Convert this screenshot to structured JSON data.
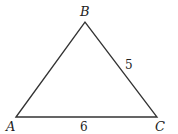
{
  "figure": {
    "type": "triangle",
    "vertices": [
      {
        "label": "A",
        "x": 16,
        "y": 117
      },
      {
        "label": "B",
        "x": 85,
        "y": 22
      },
      {
        "label": "C",
        "x": 157,
        "y": 117
      }
    ],
    "side_labels": {
      "BC": "5",
      "AC": "6"
    },
    "stroke_color": "#333333"
  }
}
